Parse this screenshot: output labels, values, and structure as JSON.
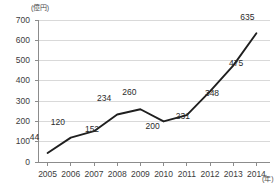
{
  "chart_data": {
    "type": "line",
    "title": "",
    "subtitle": "",
    "xlabel": "(年)",
    "ylabel": "(億円)",
    "categories": [
      "2005",
      "2006",
      "2007",
      "2008",
      "2009",
      "2010",
      "2011",
      "2012",
      "2013",
      "2014"
    ],
    "values": [
      44,
      120,
      152,
      234,
      260,
      200,
      231,
      348,
      475,
      635
    ],
    "series": [
      {
        "name": "",
        "values": [
          44,
          120,
          152,
          234,
          260,
          200,
          231,
          348,
          475,
          635
        ]
      }
    ],
    "x": [
      2005,
      2006,
      2007,
      2008,
      2009,
      2010,
      2011,
      2012,
      2013,
      2014
    ],
    "ylim": [
      0,
      700
    ],
    "yticks": [
      0,
      100,
      200,
      300,
      400,
      500,
      600,
      700
    ],
    "ytick_labels": [
      "0",
      "100",
      "200",
      "300",
      "400",
      "500",
      "600",
      "700"
    ],
    "xtick_labels": [
      "2005",
      "2006",
      "2007",
      "2008",
      "2009",
      "2010",
      "2011",
      "2012",
      "2013",
      "2014"
    ],
    "data_labels": [
      "44",
      "120",
      "152",
      "234",
      "260",
      "200",
      "231",
      "348",
      "475",
      "635"
    ],
    "grid": true,
    "grid_axis": "y",
    "legend": false,
    "legend_position": "none",
    "markers": false,
    "line_color": "#1f1f1f",
    "grid_color": "#d9d9d9",
    "axis_color": "#8c8c8c",
    "text_color": "#3c3c3c",
    "background_color": "#ffffff"
  },
  "axis": {
    "y_unit": "(億円)",
    "x_unit": "(年)"
  },
  "colors": {
    "line": "#1f1f1f",
    "grid": "#d9d9d9",
    "axis": "#8c8c8c",
    "text": "#3c3c3c",
    "background": "#ffffff"
  }
}
